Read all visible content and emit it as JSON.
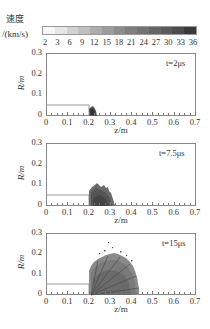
{
  "colorbar": {
    "title_line1": "速度",
    "title_line2": "/(km/s)",
    "ticks": [
      "2",
      "3",
      "6",
      "9",
      "12",
      "15",
      "18",
      "21",
      "24",
      "27",
      "30",
      "33",
      "36"
    ],
    "colors": [
      "#f7f7f7",
      "#e6e6e6",
      "#d2d2d2",
      "#c0c0c0",
      "#acacac",
      "#9c9c9c",
      "#8c8c8c",
      "#7e7e7e",
      "#727272",
      "#666666",
      "#5a5a5a",
      "#4c4c4c",
      "#3a3a3a"
    ]
  },
  "chart_data": [
    {
      "type": "area",
      "title": "t=2μs",
      "xlabel": "z/m",
      "ylabel": "R/m",
      "xlim": [
        0,
        0.7
      ],
      "ylim": [
        0,
        0.3
      ],
      "xticks": [
        "0",
        "0.1",
        "0.2",
        "0.3",
        "0.4",
        "0.5",
        "0.6",
        "0.7"
      ],
      "yticks": [
        "0",
        "0.1",
        "0.2",
        "0.3"
      ],
      "projectile_outline": {
        "z": [
          0,
          0.2
        ],
        "R": 0.05
      },
      "debris_cloud": {
        "z_range": [
          0.2,
          0.24
        ],
        "R_max": 0.04
      }
    },
    {
      "type": "area",
      "title": "t=7.5μs",
      "xlabel": "z/m",
      "ylabel": "R/m",
      "xlim": [
        0,
        0.7
      ],
      "ylim": [
        0,
        0.3
      ],
      "xticks": [
        "0",
        "0.1",
        "0.2",
        "0.3",
        "0.4",
        "0.5",
        "0.6",
        "0.7"
      ],
      "yticks": [
        "0",
        "0.1",
        "0.2",
        "0.3"
      ],
      "projectile_outline": {
        "z": [
          0,
          0.2
        ],
        "R": 0.05
      },
      "debris_cloud": {
        "z_range": [
          0.2,
          0.33
        ],
        "R_max": 0.1
      }
    },
    {
      "type": "area",
      "title": "t=15μs",
      "xlabel": "z/m",
      "ylabel": "R/m",
      "xlim": [
        0,
        0.7
      ],
      "ylim": [
        0,
        0.3
      ],
      "xticks": [
        "0",
        "0.1",
        "0.2",
        "0.3",
        "0.4",
        "0.5",
        "0.6",
        "0.7"
      ],
      "yticks": [
        "0",
        "0.1",
        "0.2",
        "0.3"
      ],
      "projectile_outline": {
        "z": [
          0,
          0.2
        ],
        "R": 0.05
      },
      "debris_cloud": {
        "z_range": [
          0.2,
          0.45
        ],
        "R_max": 0.2
      }
    }
  ],
  "panels": [
    {
      "t_label": "t=2μs",
      "xlabel": "z/m",
      "ylabel": "R/m"
    },
    {
      "t_label": "t=7.5μs",
      "xlabel": "z/m",
      "ylabel": "R/m"
    },
    {
      "t_label": "t=15μs",
      "xlabel": "z/m",
      "ylabel": "R/m"
    }
  ]
}
